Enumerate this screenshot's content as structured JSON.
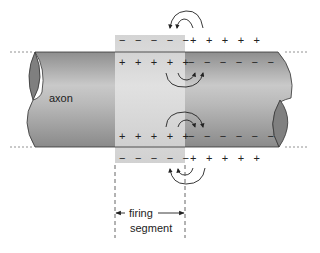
{
  "diagram": {
    "labels": {
      "axon": "axon",
      "firing": "firing",
      "segment": "segment"
    },
    "charges": {
      "top_outside_segment": "− − − − −",
      "top_outside_ahead": "+ + + + +",
      "top_inside_segment": "+ + + + +",
      "top_inside_ahead": "− − − − − −",
      "bottom_inside_segment": "+ + + + +",
      "bottom_inside_ahead": "− − − − − −",
      "bottom_outside_segment": "− − − − −",
      "bottom_outside_ahead": "+ + + + +"
    },
    "colors": {
      "axon_light": "#c8c8c8",
      "axon_dark": "#8a8a8a",
      "axon_end": "#7f7f7f",
      "segment_shade": "#d9d9d9",
      "line": "#333333"
    },
    "arrows": [
      "current-loop-top-outside",
      "current-loop-top-inside",
      "current-loop-bottom-inside",
      "current-loop-bottom-outside"
    ]
  }
}
